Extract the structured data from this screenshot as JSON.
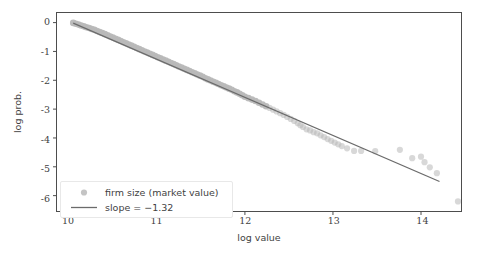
{
  "chart_data": {
    "type": "scatter",
    "title": "",
    "xlabel": "log value",
    "ylabel": "log prob.",
    "xlim": [
      9.86,
      14.46
    ],
    "ylim": [
      -6.55,
      0.35
    ],
    "xticks": [
      10,
      11,
      12,
      13,
      14
    ],
    "xticklabels": [
      "10",
      "11",
      "12",
      "13",
      "14"
    ],
    "yticks": [
      0,
      -1,
      -2,
      -3,
      -4,
      -5,
      -6
    ],
    "yticklabels": [
      "0",
      "-1",
      "-2",
      "-3",
      "-4",
      "-5",
      "-6"
    ],
    "grid": false,
    "legend_position": "lower left",
    "series": [
      {
        "name": "firm size (market value)",
        "type": "scatter",
        "marker": "o",
        "color": "#b8b8b8",
        "points": [
          [
            10.05,
            -0.01
          ],
          [
            10.08,
            -0.04
          ],
          [
            10.11,
            -0.07
          ],
          [
            10.14,
            -0.1
          ],
          [
            10.17,
            -0.13
          ],
          [
            10.2,
            -0.16
          ],
          [
            10.23,
            -0.19
          ],
          [
            10.26,
            -0.22
          ],
          [
            10.29,
            -0.25
          ],
          [
            10.32,
            -0.29
          ],
          [
            10.35,
            -0.33
          ],
          [
            10.38,
            -0.36
          ],
          [
            10.41,
            -0.4
          ],
          [
            10.44,
            -0.44
          ],
          [
            10.47,
            -0.48
          ],
          [
            10.5,
            -0.52
          ],
          [
            10.53,
            -0.56
          ],
          [
            10.56,
            -0.6
          ],
          [
            10.59,
            -0.64
          ],
          [
            10.62,
            -0.68
          ],
          [
            10.65,
            -0.72
          ],
          [
            10.68,
            -0.76
          ],
          [
            10.71,
            -0.8
          ],
          [
            10.74,
            -0.84
          ],
          [
            10.77,
            -0.88
          ],
          [
            10.8,
            -0.92
          ],
          [
            10.83,
            -0.96
          ],
          [
            10.86,
            -1.0
          ],
          [
            10.89,
            -1.04
          ],
          [
            10.92,
            -1.08
          ],
          [
            10.95,
            -1.12
          ],
          [
            10.98,
            -1.16
          ],
          [
            11.01,
            -1.2
          ],
          [
            11.04,
            -1.24
          ],
          [
            11.07,
            -1.28
          ],
          [
            11.1,
            -1.32
          ],
          [
            11.13,
            -1.36
          ],
          [
            11.16,
            -1.4
          ],
          [
            11.19,
            -1.44
          ],
          [
            11.22,
            -1.48
          ],
          [
            11.25,
            -1.52
          ],
          [
            11.28,
            -1.56
          ],
          [
            11.31,
            -1.6
          ],
          [
            11.34,
            -1.64
          ],
          [
            11.37,
            -1.68
          ],
          [
            11.4,
            -1.72
          ],
          [
            11.43,
            -1.76
          ],
          [
            11.46,
            -1.8
          ],
          [
            11.49,
            -1.84
          ],
          [
            11.52,
            -1.88
          ],
          [
            11.55,
            -1.93
          ],
          [
            11.58,
            -1.97
          ],
          [
            11.61,
            -2.01
          ],
          [
            11.64,
            -2.05
          ],
          [
            11.67,
            -2.09
          ],
          [
            11.7,
            -2.13
          ],
          [
            11.73,
            -2.17
          ],
          [
            11.76,
            -2.21
          ],
          [
            11.79,
            -2.25
          ],
          [
            11.82,
            -2.29
          ],
          [
            11.85,
            -2.33
          ],
          [
            11.88,
            -2.38
          ],
          [
            11.91,
            -2.42
          ],
          [
            11.94,
            -2.47
          ],
          [
            11.97,
            -2.52
          ],
          [
            12.0,
            -2.57
          ],
          [
            12.04,
            -2.62
          ],
          [
            12.08,
            -2.67
          ],
          [
            12.12,
            -2.72
          ],
          [
            12.16,
            -2.78
          ],
          [
            12.2,
            -2.84
          ],
          [
            12.24,
            -2.9
          ],
          [
            12.28,
            -2.96
          ],
          [
            12.32,
            -3.02
          ],
          [
            12.36,
            -3.08
          ],
          [
            12.4,
            -3.14
          ],
          [
            12.44,
            -3.2
          ],
          [
            12.48,
            -3.27
          ],
          [
            12.52,
            -3.34
          ],
          [
            12.56,
            -3.41
          ],
          [
            12.6,
            -3.49
          ],
          [
            12.63,
            -3.56
          ],
          [
            12.66,
            -3.62
          ],
          [
            12.7,
            -3.7
          ],
          [
            12.74,
            -3.74
          ],
          [
            12.78,
            -3.8
          ],
          [
            12.82,
            -3.84
          ],
          [
            12.86,
            -3.91
          ],
          [
            12.9,
            -3.97
          ],
          [
            12.94,
            -4.04
          ],
          [
            12.98,
            -4.1
          ],
          [
            13.02,
            -4.16
          ],
          [
            13.06,
            -4.22
          ],
          [
            13.1,
            -4.28
          ],
          [
            13.16,
            -4.36
          ],
          [
            13.24,
            -4.45
          ],
          [
            13.32,
            -4.45
          ],
          [
            13.48,
            -4.46
          ],
          [
            13.76,
            -4.41
          ],
          [
            13.9,
            -4.7
          ],
          [
            14.0,
            -4.65
          ],
          [
            14.04,
            -4.84
          ],
          [
            14.1,
            -5.02
          ],
          [
            14.18,
            -5.22
          ],
          [
            14.42,
            -6.2
          ]
        ]
      }
    ],
    "fit_line": {
      "name": "slope = -1.32",
      "color": "#6b6b6b",
      "slope": -1.32,
      "x_start": 10.05,
      "y_start": -0.02,
      "x_end": 14.21,
      "y_end": -5.51
    },
    "legend_entries": [
      {
        "label": "firm size (market value)",
        "marker": "dot",
        "color": "#c4c4c4"
      },
      {
        "label": "slope = −1.32",
        "marker": "line",
        "color": "#6b6b6b"
      }
    ]
  },
  "axes": {
    "x_label": "log value",
    "y_label": "log prob.",
    "x_tick_0": "10",
    "x_tick_1": "11",
    "x_tick_2": "12",
    "x_tick_3": "13",
    "x_tick_4": "14",
    "y_tick_0": "0",
    "y_tick_1": "-1",
    "y_tick_2": "-2",
    "y_tick_3": "-3",
    "y_tick_4": "-4",
    "y_tick_5": "-5",
    "y_tick_6": "-6"
  },
  "legend": {
    "scatter_label": "firm size (market value)",
    "line_label": "slope = −1.32"
  },
  "colors": {
    "scatter": "#b8b8b8",
    "scatter_dense": "#4a4a4a",
    "fit_line": "#6b6b6b",
    "axis": "#4d4d4d",
    "text": "#3f3f3f",
    "background": "#ffffff",
    "legend_border": "#e8e8e8"
  }
}
